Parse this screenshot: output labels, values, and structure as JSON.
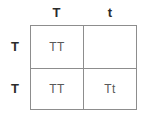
{
  "diagram": {
    "type": "punnett-square",
    "rows": 2,
    "columns": 2,
    "border_color": "#8d8d8d",
    "header_text_color": "#2b2b2b",
    "cell_text_color": "#595959",
    "background_color": "#ffffff",
    "column_headers": [
      {
        "label": "T"
      },
      {
        "label": "t"
      }
    ],
    "row_labels": [
      {
        "label": "T"
      },
      {
        "label": "T"
      }
    ],
    "cells": [
      {
        "label": "TT"
      },
      {
        "label": ""
      },
      {
        "label": "TT"
      },
      {
        "label": "Tt"
      }
    ]
  }
}
